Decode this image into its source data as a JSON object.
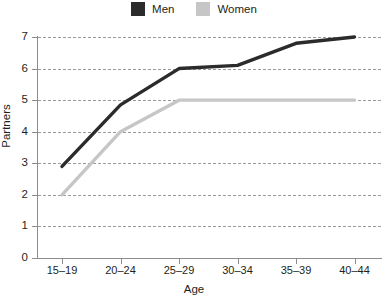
{
  "legend": {
    "position": "top-center",
    "entries": [
      {
        "label": "Men",
        "color": "#2b2b2b",
        "swatch_name": "men-swatch"
      },
      {
        "label": "Women",
        "color": "#c6c6c6",
        "swatch_name": "women-swatch"
      }
    ]
  },
  "axes": {
    "y_title": "Partners",
    "x_title": "Age",
    "y_ticks": [
      "0",
      "1",
      "2",
      "3",
      "4",
      "5",
      "6",
      "7"
    ],
    "x_ticks": [
      "15–19",
      "20–24",
      "25–29",
      "30–34",
      "35–39",
      "40–44"
    ]
  },
  "colors": {
    "men_line": "#2b2b2b",
    "women_line": "#c6c6c6",
    "gridline": "#9a9a9a",
    "axis": "#8c8c8c",
    "text": "#231f20",
    "background": "#ffffff"
  },
  "chart_data": {
    "type": "line",
    "title": "",
    "subtitle": "",
    "xlabel": "Age",
    "ylabel": "Partners",
    "categories": [
      "15–19",
      "20–24",
      "25–29",
      "30–34",
      "35–39",
      "40–44"
    ],
    "series": [
      {
        "name": "Men",
        "color": "#2b2b2b",
        "values": [
          2.9,
          4.85,
          6.0,
          6.1,
          6.8,
          7.0
        ]
      },
      {
        "name": "Women",
        "color": "#c6c6c6",
        "values": [
          2.0,
          4.0,
          5.0,
          5.0,
          5.0,
          5.0
        ]
      }
    ],
    "ylim": [
      0,
      7
    ],
    "yticks": [
      0,
      1,
      2,
      3,
      4,
      5,
      6,
      7
    ],
    "grid": "horizontal-dashed",
    "legend": "top-center"
  }
}
